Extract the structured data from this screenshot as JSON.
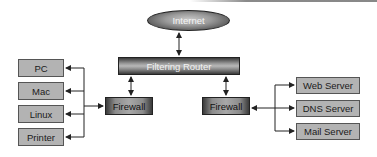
{
  "diagram": {
    "internet": {
      "label": "Internet"
    },
    "router": {
      "label": "Filtering Router"
    },
    "firewall_left": {
      "label": "Firewall"
    },
    "firewall_right": {
      "label": "Firewall"
    },
    "clients": [
      {
        "label": "PC"
      },
      {
        "label": "Mac"
      },
      {
        "label": "Linux"
      },
      {
        "label": "Printer"
      }
    ],
    "servers": [
      {
        "label": "Web Server"
      },
      {
        "label": "DNS Server"
      },
      {
        "label": "Mail Server"
      }
    ],
    "colors": {
      "client_fill": "#b3b3b3",
      "dark_node": "#3a3a3a",
      "line": "#222222"
    }
  }
}
